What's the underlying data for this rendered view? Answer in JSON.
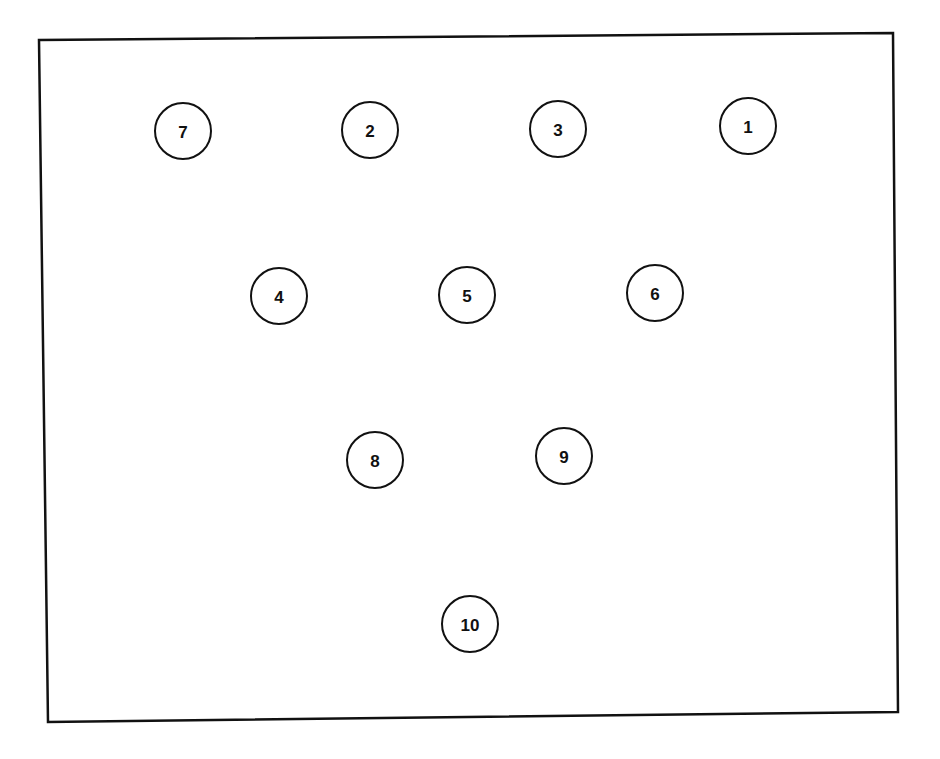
{
  "diagram": {
    "type": "bowling-pin-layout",
    "frame": {
      "corners": [
        [
          39,
          40
        ],
        [
          893,
          33
        ],
        [
          898,
          712
        ],
        [
          48,
          722
        ]
      ],
      "stroke": "#111111",
      "stroke_width": 2.5
    },
    "pin_radius": 28,
    "pin_stroke": "#111111",
    "pins": [
      {
        "label": "7",
        "cx": 183,
        "cy": 131
      },
      {
        "label": "2",
        "cx": 370,
        "cy": 130
      },
      {
        "label": "3",
        "cx": 558,
        "cy": 129
      },
      {
        "label": "1",
        "cx": 748,
        "cy": 126
      },
      {
        "label": "4",
        "cx": 279,
        "cy": 296
      },
      {
        "label": "5",
        "cx": 467,
        "cy": 295
      },
      {
        "label": "6",
        "cx": 655,
        "cy": 293
      },
      {
        "label": "8",
        "cx": 375,
        "cy": 460
      },
      {
        "label": "9",
        "cx": 564,
        "cy": 456
      },
      {
        "label": "10",
        "cx": 470,
        "cy": 624
      }
    ]
  }
}
